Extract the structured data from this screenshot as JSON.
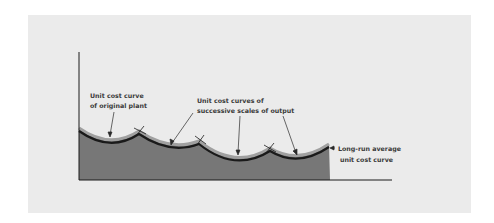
{
  "diagram": {
    "labels": {
      "original_plant_line1": "Unit cost curve",
      "original_plant_line2": "of original plant",
      "successive_line1": "Unit cost curves of",
      "successive_line2": "successive scales of output",
      "long_run_line1": "Long-run average",
      "long_run_line2": "unit cost curve"
    },
    "colors": {
      "panel_bg": "#ebebeb",
      "area_fill": "#777777",
      "band_light": "#9a9a9a",
      "band_dark": "#1a1a1a",
      "axis": "#1a1a1a",
      "text": "#3a3a3a"
    }
  }
}
